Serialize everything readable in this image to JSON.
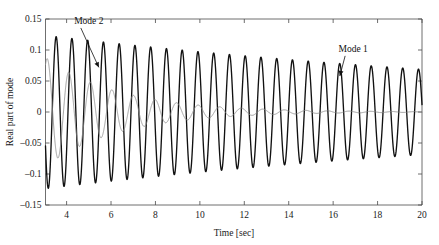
{
  "chart_data": {
    "type": "line",
    "title": "",
    "xlabel": "Time [sec]",
    "ylabel": "Real part of mode",
    "xlim": [
      3.05,
      20
    ],
    "ylim": [
      -0.15,
      0.15
    ],
    "xticks": [
      4,
      6,
      8,
      10,
      12,
      14,
      16,
      18,
      20
    ],
    "xtick_labels": [
      "4",
      "6",
      "8",
      "10",
      "12",
      "14",
      "16",
      "18",
      "20"
    ],
    "yticks": [
      -0.15,
      -0.1,
      -0.05,
      0,
      0.05,
      0.1,
      0.15
    ],
    "ytick_labels": [
      "-0.15",
      "-0.1",
      "-0.05",
      "0",
      "0.05",
      "0.1",
      "0.15"
    ],
    "grid": false,
    "legend": "none",
    "annotations": [
      {
        "text": "Mode 2",
        "label_x": 5.0,
        "label_y": 0.142,
        "tip_x": 5.45,
        "tip_y": 0.072,
        "color": "#111111"
      },
      {
        "text": "Mode 1",
        "label_x": 16.9,
        "label_y": 0.097,
        "tip_x": 16.3,
        "tip_y": 0.058,
        "color": "#111111"
      }
    ],
    "series": [
      {
        "name": "Mode 1",
        "color": "#111111",
        "linewidth": 1.35,
        "model": "damped_sine",
        "amplitude0": 0.1235,
        "decay_rate": 0.0345,
        "frequency_hz": 1.41,
        "phase_rad": 3.6,
        "t_start": 3.05,
        "t_end": 20.0,
        "description": "Lightly damped dominant mode, amplitude decaying from about 0.123 at t=3.1 s to about 0.068 at t=20 s"
      },
      {
        "name": "Mode 2",
        "color": "#8d8d8d",
        "linewidth": 0.85,
        "model": "damped_sine",
        "amplitude0": 0.088,
        "decay_rate": 0.3,
        "frequency_hz": 1.03,
        "phase_rad": 1.05,
        "t_start": 3.05,
        "t_end": 20.0,
        "description": "Heavily damped secondary mode, amplitude decaying from about 0.088 at t=3.1 s to nearly zero after t=12 s"
      }
    ],
    "axis_pixels": {
      "left": 45.5,
      "right": 422.0,
      "top": 19.0,
      "bottom": 205.0
    }
  },
  "figure": {
    "background_color": "#ffffff",
    "axis_color": "#4a4a4a",
    "text_color": "#1a1a1a"
  }
}
